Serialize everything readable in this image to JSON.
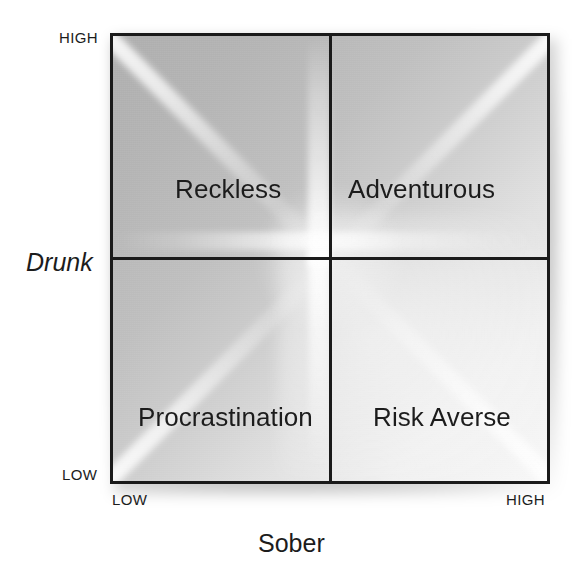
{
  "chart_data": {
    "type": "table",
    "title": "",
    "subtitle": "",
    "xlabel": "Sober",
    "ylabel": "Drunk",
    "x_ticks": [
      "LOW",
      "HIGH"
    ],
    "y_ticks": [
      "LOW",
      "HIGH"
    ],
    "grid": true,
    "legend": null,
    "categories": [
      "Reckless",
      "Adventurous",
      "Procrastination",
      "Risk Averse"
    ],
    "cells": [
      {
        "label": "Reckless",
        "x": "LOW",
        "y": "HIGH",
        "quadrant": "top-left"
      },
      {
        "label": "Adventurous",
        "x": "HIGH",
        "y": "HIGH",
        "quadrant": "top-right"
      },
      {
        "label": "Procrastination",
        "x": "LOW",
        "y": "LOW",
        "quadrant": "bottom-left"
      },
      {
        "label": "Risk Averse",
        "x": "HIGH",
        "y": "LOW",
        "quadrant": "bottom-right"
      }
    ],
    "colors": {
      "frame": "#1a1a1a",
      "text": "#1c1c1c",
      "fill_dark": "#b0b0b0",
      "fill_light": "#f8f8f8",
      "background": "#ffffff"
    }
  },
  "axes": {
    "y": {
      "title": "Drunk",
      "high_label": "HIGH",
      "low_label": "LOW"
    },
    "x": {
      "title": "Sober",
      "high_label": "HIGH",
      "low_label": "LOW"
    }
  },
  "quadrants": {
    "top_left": "Reckless",
    "top_right": "Adventurous",
    "bottom_left": "Procrastination",
    "bottom_right": "Risk Averse"
  }
}
